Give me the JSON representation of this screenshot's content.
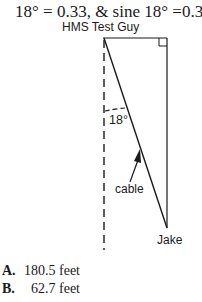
{
  "header": {
    "text": "18° = 0.33, & sine 18° =0.31"
  },
  "diagram": {
    "top_label": "HMS Test Guy",
    "angle_label": "18°",
    "cable_label": "cable",
    "bottom_label": "Jake",
    "right_angle_marker": true,
    "dashed_vertical": true
  },
  "answers": [
    {
      "letter": "A.",
      "text": "180.5 feet"
    },
    {
      "letter": "B.",
      "text": "62.7 feet"
    }
  ]
}
